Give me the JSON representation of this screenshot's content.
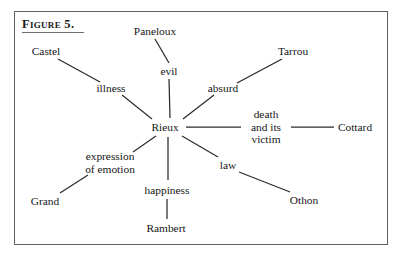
{
  "figure": {
    "title": "Figure 5.",
    "frame_color": "#5f6165",
    "text_color": "#161616",
    "line_color": "#2b2b2b",
    "background": "#ffffff"
  },
  "diagram": {
    "type": "concept-map-radial",
    "center": "Rieux",
    "nodes": [
      {
        "id": "paneloux",
        "label": "Paneloux",
        "lines": [
          "Paneloux"
        ],
        "x": 155,
        "y": 31,
        "role": "character"
      },
      {
        "id": "castel",
        "label": "Castel",
        "lines": [
          "Castel"
        ],
        "x": 46,
        "y": 51,
        "role": "character"
      },
      {
        "id": "tarrou",
        "label": "Tarrou",
        "lines": [
          "Tarrou"
        ],
        "x": 293,
        "y": 51,
        "role": "character"
      },
      {
        "id": "evil",
        "label": "evil",
        "lines": [
          "evil"
        ],
        "x": 169,
        "y": 71,
        "role": "concept"
      },
      {
        "id": "illness",
        "label": "illness",
        "lines": [
          "illness"
        ],
        "x": 111,
        "y": 88,
        "role": "concept"
      },
      {
        "id": "absurd",
        "label": "absurd",
        "lines": [
          "absurd"
        ],
        "x": 223,
        "y": 88,
        "role": "concept"
      },
      {
        "id": "death",
        "label": "death and its victim",
        "lines": [
          "death",
          "and its",
          "victim"
        ],
        "x": 266,
        "y": 127,
        "role": "concept"
      },
      {
        "id": "rieux",
        "label": "Rieux",
        "lines": [
          "Rieux"
        ],
        "x": 165,
        "y": 127,
        "role": "center"
      },
      {
        "id": "cottard",
        "label": "Cottard",
        "lines": [
          "Cottard"
        ],
        "x": 355,
        "y": 127,
        "role": "character"
      },
      {
        "id": "expression",
        "label": "expression of emotion",
        "lines": [
          "expression",
          "of emotion"
        ],
        "x": 110,
        "y": 163,
        "role": "concept"
      },
      {
        "id": "law",
        "label": "law",
        "lines": [
          "law"
        ],
        "x": 228,
        "y": 165,
        "role": "concept"
      },
      {
        "id": "happiness",
        "label": "happiness",
        "lines": [
          "happiness"
        ],
        "x": 167,
        "y": 190,
        "role": "concept"
      },
      {
        "id": "grand",
        "label": "Grand",
        "lines": [
          "Grand"
        ],
        "x": 45,
        "y": 201,
        "role": "character"
      },
      {
        "id": "othon",
        "label": "Othon",
        "lines": [
          "Othon"
        ],
        "x": 304,
        "y": 200,
        "role": "character"
      },
      {
        "id": "rambert",
        "label": "Rambert",
        "lines": [
          "Rambert"
        ],
        "x": 166,
        "y": 228,
        "role": "character"
      }
    ],
    "edges": [
      {
        "from": "paneloux",
        "to": "evil",
        "x1": 155,
        "y1": 39,
        "x2": 169,
        "y2": 63
      },
      {
        "from": "evil",
        "to": "rieux",
        "x1": 169,
        "y1": 79,
        "x2": 170,
        "y2": 118
      },
      {
        "from": "castel",
        "to": "illness",
        "x1": 58,
        "y1": 59,
        "x2": 100,
        "y2": 82
      },
      {
        "from": "illness",
        "to": "rieux",
        "x1": 122,
        "y1": 95,
        "x2": 152,
        "y2": 119
      },
      {
        "from": "tarrou",
        "to": "absurd",
        "x1": 282,
        "y1": 59,
        "x2": 237,
        "y2": 83
      },
      {
        "from": "absurd",
        "to": "rieux",
        "x1": 214,
        "y1": 95,
        "x2": 183,
        "y2": 119
      },
      {
        "from": "rieux",
        "to": "death",
        "x1": 186,
        "y1": 127,
        "x2": 241,
        "y2": 127
      },
      {
        "from": "death",
        "to": "cottard",
        "x1": 291,
        "y1": 127,
        "x2": 334,
        "y2": 127
      },
      {
        "from": "rieux",
        "to": "expression",
        "x1": 156,
        "y1": 136,
        "x2": 133,
        "y2": 152
      },
      {
        "from": "expression",
        "to": "grand",
        "x1": 88,
        "y1": 175,
        "x2": 60,
        "y2": 193
      },
      {
        "from": "rieux",
        "to": "happiness",
        "x1": 168,
        "y1": 137,
        "x2": 168,
        "y2": 180
      },
      {
        "from": "happiness",
        "to": "rambert",
        "x1": 167,
        "y1": 199,
        "x2": 167,
        "y2": 219
      },
      {
        "from": "rieux",
        "to": "law",
        "x1": 182,
        "y1": 136,
        "x2": 218,
        "y2": 157
      },
      {
        "from": "law",
        "to": "othon",
        "x1": 239,
        "y1": 172,
        "x2": 290,
        "y2": 192
      }
    ]
  }
}
